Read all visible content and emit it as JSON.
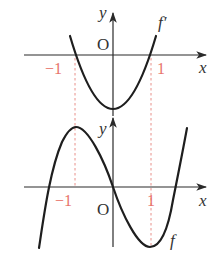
{
  "diagram": {
    "colors": {
      "axis": "#2a2a2a",
      "curve": "#1e1e1e",
      "guide": "#e8908a",
      "tick_label": "#e8736b"
    },
    "upper_graph": {
      "curve_label": "f′",
      "x_axis_label": "x",
      "y_axis_label": "y",
      "origin_label": "O",
      "tick_neg": "−1",
      "tick_pos": "1",
      "curve_type": "parabola with roots at -1 and 1"
    },
    "lower_graph": {
      "curve_label": "f",
      "x_axis_label": "x",
      "y_axis_label": "y",
      "origin_label": "O",
      "tick_neg": "−1",
      "tick_pos": "1",
      "curve_type": "cubic with local max at -1 and local min at 1"
    }
  }
}
